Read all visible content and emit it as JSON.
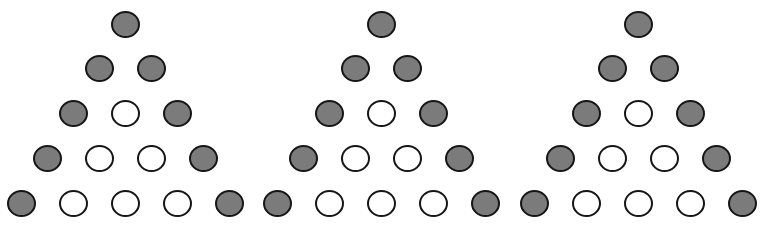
{
  "diagram": {
    "colors": {
      "filled": "#7b7b7b",
      "empty": "#ffffff",
      "stroke": "#151515",
      "background": "#ffffff"
    },
    "row_y": [
      25,
      69,
      114,
      159,
      204
    ],
    "h_spacing": 52,
    "triangles": [
      {
        "id": "triangle-1",
        "apex_x": 126,
        "rows": [
          [
            "filled"
          ],
          [
            "filled",
            "filled"
          ],
          [
            "filled",
            "empty",
            "filled"
          ],
          [
            "filled",
            "empty",
            "empty",
            "filled"
          ],
          [
            "filled",
            "empty",
            "empty",
            "empty",
            "filled"
          ]
        ]
      },
      {
        "id": "triangle-2",
        "apex_x": 382,
        "rows": [
          [
            "filled"
          ],
          [
            "filled",
            "filled"
          ],
          [
            "filled",
            "empty",
            "filled"
          ],
          [
            "filled",
            "empty",
            "empty",
            "filled"
          ],
          [
            "filled",
            "empty",
            "empty",
            "empty",
            "filled"
          ]
        ]
      },
      {
        "id": "triangle-3",
        "apex_x": 639,
        "rows": [
          [
            "filled"
          ],
          [
            "filled",
            "filled"
          ],
          [
            "filled",
            "empty",
            "filled"
          ],
          [
            "filled",
            "empty",
            "empty",
            "filled"
          ],
          [
            "filled",
            "empty",
            "empty",
            "empty",
            "filled"
          ]
        ]
      }
    ]
  }
}
